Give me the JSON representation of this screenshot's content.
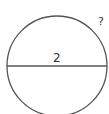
{
  "diagram": {
    "shape": "circle",
    "diameter_label": "2",
    "unknown_label": "?",
    "stroke_color": "#555555"
  }
}
